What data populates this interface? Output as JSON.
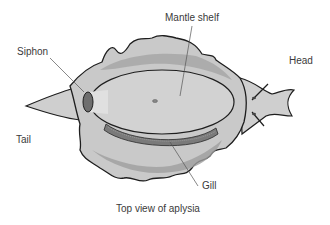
{
  "diagram": {
    "caption": "Top view of aplysia",
    "labels": {
      "mantle_shelf": "Mantle shelf",
      "siphon": "Siphon",
      "head": "Head",
      "tail": "Tail",
      "gill": "Gill"
    },
    "colors": {
      "body_outline": "#1e1e1e",
      "body_light": "#d4d4d4",
      "body_mid": "#bdbdbd",
      "body_dark": "#9a9a9a",
      "mantle": "#cfcfcf",
      "gill": "#7a7a7a",
      "siphon": "#6e6e6e",
      "leader_line": "#555555"
    }
  }
}
